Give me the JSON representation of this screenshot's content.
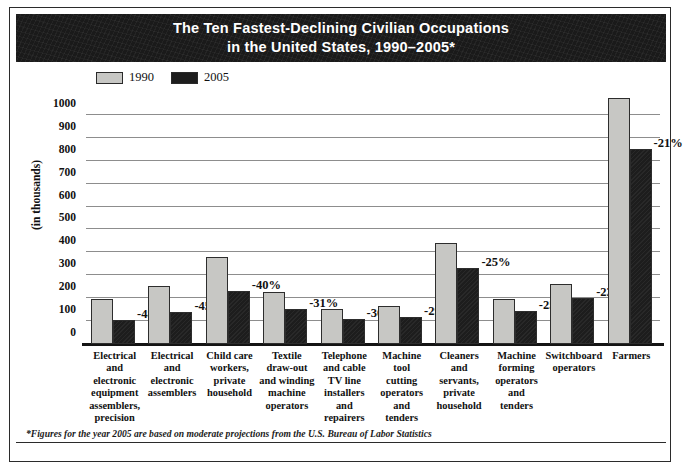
{
  "title": {
    "line1": "The Ten Fastest-Declining Civilian Occupations",
    "line2": "in the United States, 1990–2005*"
  },
  "legend": {
    "position": "top-left",
    "items": [
      {
        "label": "1990",
        "color": "#c7c7c4"
      },
      {
        "label": "2005",
        "color": "#1d1d1d"
      }
    ]
  },
  "axis": {
    "ylabel": "(in thousands)",
    "yticks": [
      "0",
      "100",
      "200",
      "300",
      "400",
      "500",
      "600",
      "700",
      "800",
      "900",
      "1000"
    ]
  },
  "footnote": "*Figures for the year 2005 are based on moderate projections from the U.S. Bureau of Labor Statistics",
  "chart_data": {
    "type": "bar",
    "title": "The Ten Fastest-Declining Civilian Occupations in the United States, 1990–2005*",
    "xlabel": "",
    "ylabel": "(in thousands)",
    "ylim": [
      0,
      1100
    ],
    "yticks": [
      0,
      100,
      200,
      300,
      400,
      500,
      600,
      700,
      800,
      900,
      1000
    ],
    "grid": true,
    "legend_position": "top-left",
    "categories": [
      "Electrical and electronic equipment assemblers, precision",
      "Electrical and electronic assemblers",
      "Child care workers, private household",
      "Textile draw-out and winding machine operators",
      "Telephone and cable TV line installers and repairers",
      "Machine tool cutting operators and tenders",
      "Cleaners and servants, private household",
      "Machine forming operators and tenders",
      "Switchboard operators",
      "Farmers"
    ],
    "category_lines": [
      [
        "Electrical",
        "and",
        "electronic",
        "equipment",
        "assemblers,",
        "precision"
      ],
      [
        "Electrical",
        "and",
        "electronic",
        "assemblers"
      ],
      [
        "Child care",
        "workers,",
        "private",
        "household"
      ],
      [
        "Textile",
        "draw-out",
        "and winding",
        "machine",
        "operators"
      ],
      [
        "Telephone",
        "and cable",
        "TV line",
        "installers",
        "and",
        "repairers"
      ],
      [
        "Machine",
        "tool",
        "cutting",
        "operators",
        "and",
        "tenders"
      ],
      [
        "Cleaners",
        "and",
        "servants,",
        "private",
        "household"
      ],
      [
        "Machine",
        "forming",
        "operators",
        "and",
        "tenders"
      ],
      [
        "Switchboard",
        "operators"
      ],
      [
        "Farmers"
      ]
    ],
    "series": [
      {
        "name": "1990",
        "color": "#c7c7c4",
        "values": [
          195,
          255,
          380,
          225,
          155,
          165,
          440,
          195,
          260,
          1075
        ]
      },
      {
        "name": "2005",
        "color": "#1d1d1d",
        "values": [
          105,
          140,
          230,
          155,
          110,
          120,
          330,
          145,
          200,
          850
        ]
      }
    ],
    "change_labels": [
      "-48%",
      "-45%",
      "-40%",
      "-31%",
      "-30%",
      "-29%",
      "-25%",
      "-25%",
      "-23%",
      "-21%"
    ]
  }
}
